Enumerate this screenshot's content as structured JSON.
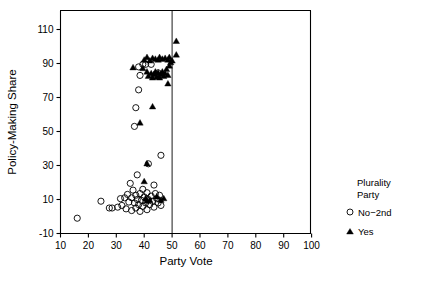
{
  "chart_data": {
    "type": "scatter",
    "title": "",
    "xlabel": "Party Vote",
    "ylabel": "Policy-Making Share",
    "xlim": [
      8,
      102
    ],
    "ylim": [
      -12,
      112
    ],
    "xticks": [
      10,
      20,
      30,
      40,
      50,
      60,
      70,
      80,
      90,
      100
    ],
    "yticks": [
      -10,
      10,
      30,
      50,
      70,
      90,
      110
    ],
    "grid": false,
    "reference_lines": [
      {
        "orientation": "vertical",
        "x": 50
      }
    ],
    "legend": {
      "position": "right",
      "title_line1": "Plurality",
      "title_line2": "Party",
      "entries": [
        {
          "label": "No−2nd",
          "marker": "open-circle"
        },
        {
          "label": "Yes",
          "marker": "filled-triangle"
        }
      ]
    },
    "series": [
      {
        "name": "No−2nd",
        "marker": "open-circle",
        "points": [
          [
            16.0,
            -1.0
          ],
          [
            24.5,
            9.0
          ],
          [
            27.5,
            5.0
          ],
          [
            28.5,
            5.0
          ],
          [
            30.5,
            5.5
          ],
          [
            31.5,
            10.5
          ],
          [
            32.0,
            6.5
          ],
          [
            33.0,
            11.0
          ],
          [
            33.5,
            4.5
          ],
          [
            34.0,
            13.0
          ],
          [
            34.5,
            8.5
          ],
          [
            35.0,
            19.5
          ],
          [
            35.5,
            11.0
          ],
          [
            35.5,
            3.5
          ],
          [
            36.0,
            15.5
          ],
          [
            36.5,
            8.0
          ],
          [
            37.0,
            12.5
          ],
          [
            37.0,
            5.0
          ],
          [
            37.5,
            24.5
          ],
          [
            37.5,
            10.0
          ],
          [
            38.0,
            7.0
          ],
          [
            38.5,
            13.5
          ],
          [
            38.5,
            3.0
          ],
          [
            39.0,
            9.5
          ],
          [
            39.5,
            16.0
          ],
          [
            39.5,
            6.0
          ],
          [
            40.0,
            11.5
          ],
          [
            40.5,
            8.0
          ],
          [
            41.0,
            14.0
          ],
          [
            41.0,
            4.0
          ],
          [
            41.5,
            10.0
          ],
          [
            42.0,
            7.0
          ],
          [
            42.5,
            12.0
          ],
          [
            43.0,
            9.0
          ],
          [
            43.5,
            18.5
          ],
          [
            43.5,
            5.5
          ],
          [
            44.0,
            13.5
          ],
          [
            44.5,
            10.5
          ],
          [
            45.0,
            8.0
          ],
          [
            45.5,
            12.5
          ],
          [
            46.0,
            6.5
          ],
          [
            36.5,
            53.0
          ],
          [
            37.0,
            64.0
          ],
          [
            38.0,
            74.5
          ],
          [
            38.5,
            83.0
          ],
          [
            38.0,
            88.0
          ],
          [
            39.5,
            89.5
          ],
          [
            40.5,
            89.5
          ],
          [
            42.5,
            89.5
          ],
          [
            46.0,
            36.0
          ],
          [
            41.5,
            31.0
          ],
          [
            44.0,
            83.0
          ],
          [
            45.0,
            84.5
          ]
        ]
      },
      {
        "name": "Yes",
        "marker": "filled-triangle",
        "points": [
          [
            36.0,
            87.5
          ],
          [
            38.5,
            55.0
          ],
          [
            43.0,
            64.5
          ],
          [
            41.0,
            31.0
          ],
          [
            40.0,
            20.5
          ],
          [
            40.5,
            10.5
          ],
          [
            41.0,
            9.0
          ],
          [
            42.0,
            9.5
          ],
          [
            44.5,
            11.5
          ],
          [
            46.0,
            9.5
          ],
          [
            47.0,
            10.5
          ],
          [
            41.0,
            93.5
          ],
          [
            42.0,
            91.5
          ],
          [
            43.0,
            93.0
          ],
          [
            44.0,
            92.5
          ],
          [
            45.0,
            92.0
          ],
          [
            45.5,
            93.5
          ],
          [
            46.5,
            92.5
          ],
          [
            47.5,
            93.0
          ],
          [
            48.5,
            92.0
          ],
          [
            49.0,
            93.5
          ],
          [
            41.0,
            85.0
          ],
          [
            41.5,
            82.5
          ],
          [
            42.5,
            84.0
          ],
          [
            43.0,
            81.5
          ],
          [
            43.5,
            83.5
          ],
          [
            44.0,
            85.0
          ],
          [
            44.5,
            82.0
          ],
          [
            45.0,
            84.5
          ],
          [
            45.5,
            81.5
          ],
          [
            46.0,
            83.5
          ],
          [
            46.5,
            85.0
          ],
          [
            47.0,
            82.5
          ],
          [
            47.5,
            84.0
          ],
          [
            48.0,
            86.5
          ],
          [
            48.5,
            83.0
          ],
          [
            49.0,
            88.5
          ],
          [
            49.5,
            90.5
          ],
          [
            50.0,
            91.5
          ],
          [
            48.5,
            78.0
          ],
          [
            51.5,
            103.0
          ],
          [
            51.5,
            95.0
          ],
          [
            39.5,
            87.0
          ],
          [
            40.0,
            92.0
          ]
        ]
      }
    ]
  }
}
